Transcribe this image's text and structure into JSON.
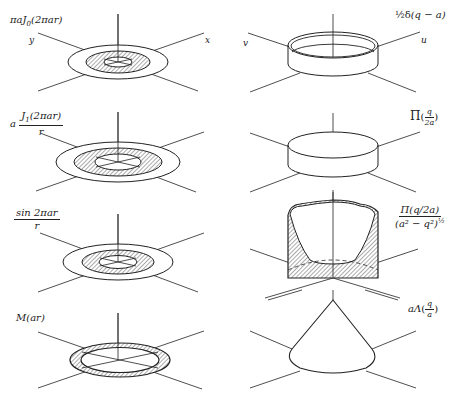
{
  "figure": {
    "stroke_color": "#222222",
    "hatch_color": "#555555",
    "background": "#ffffff"
  },
  "axes": {
    "left_top": {
      "y_label": "y",
      "x_label": "x"
    },
    "right_top": {
      "v_label": "v",
      "u_label": "u"
    }
  },
  "pairs": [
    {
      "left": {
        "label": "πaJ0(2πar)",
        "prefix": "πaJ",
        "sub": "0",
        "arg": "(2πar)",
        "shape": "concentric-rings-hatched"
      },
      "right": {
        "label": "½δ(q − a)",
        "prefix": "½δ",
        "arg": "(q − a)",
        "shape": "ring-wall"
      }
    },
    {
      "left": {
        "label": "a J1(2πar)/r",
        "coef": "a",
        "num_prefix": "J",
        "num_sub": "1",
        "num_arg": "(2πar)",
        "den": "r",
        "shape": "concentric-rings-hatched"
      },
      "right": {
        "label": "Π(q/2a)",
        "prefix": "Π",
        "num": "q",
        "den": "2a",
        "shape": "cylinder-disk"
      }
    },
    {
      "left": {
        "label": "sin 2πar / r",
        "num": "sin 2πar",
        "den": "r",
        "shape": "concentric-rings-hatched"
      },
      "right": {
        "label": "Π(q/2a) / (a² − q²)^½",
        "num": "Π(q/2a)",
        "den": "(a² − q²)",
        "den_exp": "½",
        "shape": "bowl-hatched"
      }
    },
    {
      "left": {
        "label": "M(ar)",
        "text": "M(ar)",
        "shape": "thin-ring-hatched"
      },
      "right": {
        "label": "aΛ(q/a)",
        "prefix": "aΛ",
        "num": "q",
        "den": "a",
        "shape": "cone"
      }
    }
  ]
}
